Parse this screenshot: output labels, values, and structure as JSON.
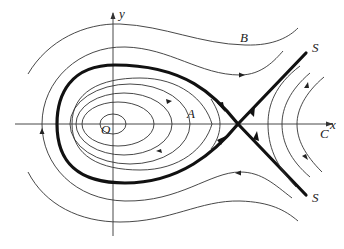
{
  "diagram": {
    "type": "phase-portrait",
    "axes": {
      "x_label": "x",
      "y_label": "y",
      "origin_label": "O"
    },
    "labels": {
      "region_A": "A",
      "region_B": "B",
      "region_C": "C",
      "separatrix_top": "S",
      "separatrix_bottom": "S"
    },
    "elements": {
      "center_point": "O",
      "saddle_point": "intersection of separatrices S",
      "homoclinic_loop": "thick closed curve through saddle enclosing region A",
      "closed_orbits_inside": 5,
      "outer_trajectories_B": 3,
      "right_trajectories_C": 3
    },
    "colors": {
      "stroke": "#333333",
      "separatrix": "#111111",
      "background": "#ffffff"
    }
  }
}
